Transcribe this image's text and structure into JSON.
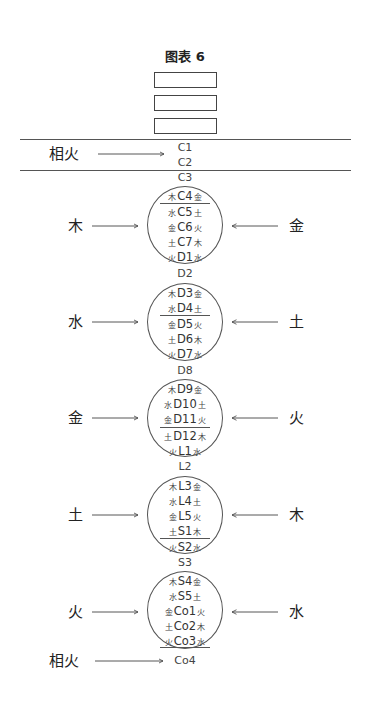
{
  "title": "图表 6",
  "boxes": 3,
  "top_section": {
    "left_label": "相火",
    "nodes": [
      "C1",
      "C2"
    ]
  },
  "groups": [
    {
      "above": "C3",
      "left": "木",
      "right": "金",
      "divider_after_row": 0,
      "rows": [
        {
          "l": "木",
          "code": "C4",
          "r": "金"
        },
        {
          "l": "水",
          "code": "C5",
          "r": "土"
        },
        {
          "l": "金",
          "code": "C6",
          "r": "火"
        },
        {
          "l": "土",
          "code": "C7",
          "r": "木"
        },
        {
          "l": "火",
          "code": "D1",
          "r": "水"
        }
      ]
    },
    {
      "above": "D2",
      "left": "水",
      "right": "土",
      "divider_after_row": 1,
      "rows": [
        {
          "l": "木",
          "code": "D3",
          "r": "金"
        },
        {
          "l": "水",
          "code": "D4",
          "r": "土"
        },
        {
          "l": "金",
          "code": "D5",
          "r": "火"
        },
        {
          "l": "土",
          "code": "D6",
          "r": "木"
        },
        {
          "l": "火",
          "code": "D7",
          "r": "水"
        }
      ]
    },
    {
      "above": "D8",
      "left": "金",
      "right": "火",
      "divider_after_row": 2,
      "rows": [
        {
          "l": "木",
          "code": "D9",
          "r": "金"
        },
        {
          "l": "水",
          "code": "D10",
          "r": "土"
        },
        {
          "l": "金",
          "code": "D11",
          "r": "火"
        },
        {
          "l": "土",
          "code": "D12",
          "r": "木"
        },
        {
          "l": "火",
          "code": "L1",
          "r": "水"
        }
      ]
    },
    {
      "above": "L2",
      "left": "土",
      "right": "木",
      "divider_after_row": 3,
      "rows": [
        {
          "l": "木",
          "code": "L3",
          "r": "金"
        },
        {
          "l": "水",
          "code": "L4",
          "r": "土"
        },
        {
          "l": "金",
          "code": "L5",
          "r": "火"
        },
        {
          "l": "土",
          "code": "S1",
          "r": "木"
        },
        {
          "l": "火",
          "code": "S2",
          "r": "水"
        }
      ]
    },
    {
      "above": "S3",
      "left": "火",
      "right": "水",
      "divider_after_row": 4,
      "rows": [
        {
          "l": "木",
          "code": "S4",
          "r": "金"
        },
        {
          "l": "水",
          "code": "S5",
          "r": "土"
        },
        {
          "l": "金",
          "code": "Co1",
          "r": "火"
        },
        {
          "l": "土",
          "code": "Co2",
          "r": "木"
        },
        {
          "l": "火",
          "code": "Co3",
          "r": "水"
        }
      ]
    }
  ],
  "bottom_section": {
    "left_label": "相火",
    "node": "Co4"
  }
}
